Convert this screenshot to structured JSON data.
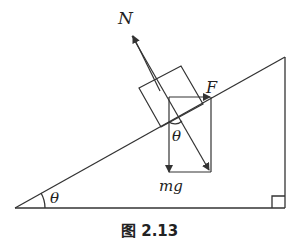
{
  "figure": {
    "caption": "图 2.13",
    "labels": {
      "normal_force": "N",
      "applied_force": "F",
      "weight": "mg",
      "angle_block": "θ",
      "angle_incline": "θ"
    },
    "colors": {
      "stroke": "#333333",
      "background": "#ffffff"
    }
  }
}
